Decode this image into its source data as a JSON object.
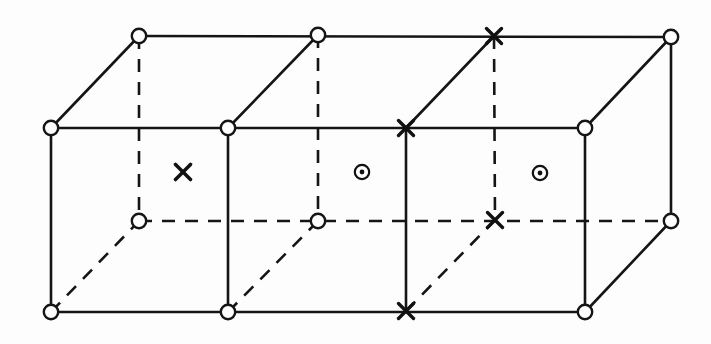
{
  "figure": {
    "background_color": "#fdfdfd",
    "line_color": "#151515",
    "canvas": {
      "width": 711,
      "height": 344
    }
  },
  "legend_symbols": [
    {
      "key": "open-circle",
      "glyph": "circle",
      "meaning": "lattice site marked by open circle"
    },
    {
      "key": "cross",
      "glyph": "x",
      "meaning": "spin pointing into the page"
    },
    {
      "key": "circle-dot",
      "glyph": "circle-dot",
      "meaning": "spin pointing out of the page"
    }
  ],
  "geometry": {
    "front_top_y": 128,
    "front_bottom_y": 312,
    "back_top_y": 36,
    "back_bottom_y": 221,
    "front_x": [
      51,
      228,
      406,
      585
    ],
    "back_x": [
      139,
      318,
      495,
      671
    ],
    "marker_radius": 7.2
  },
  "nodes": {
    "back_top": [
      {
        "name": "back-top-1",
        "x": 139,
        "y": 36,
        "symbol": "open-circle"
      },
      {
        "name": "back-top-2",
        "x": 318,
        "y": 35,
        "symbol": "open-circle"
      },
      {
        "name": "back-top-3",
        "x": 494,
        "y": 36,
        "symbol": "cross"
      },
      {
        "name": "back-top-4",
        "x": 671,
        "y": 37,
        "symbol": "open-circle"
      }
    ],
    "front_top": [
      {
        "name": "front-top-1",
        "x": 51,
        "y": 128,
        "symbol": "open-circle"
      },
      {
        "name": "front-top-2",
        "x": 228,
        "y": 128,
        "symbol": "open-circle"
      },
      {
        "name": "front-top-3",
        "x": 406,
        "y": 128,
        "symbol": "cross"
      },
      {
        "name": "front-top-4",
        "x": 585,
        "y": 128,
        "symbol": "open-circle"
      }
    ],
    "back_bottom": [
      {
        "name": "back-bottom-1",
        "x": 139,
        "y": 221,
        "symbol": "open-circle"
      },
      {
        "name": "back-bottom-2",
        "x": 318,
        "y": 221,
        "symbol": "open-circle"
      },
      {
        "name": "back-bottom-3",
        "x": 495,
        "y": 220,
        "symbol": "cross"
      },
      {
        "name": "back-bottom-4",
        "x": 671,
        "y": 221,
        "symbol": "open-circle"
      }
    ],
    "front_bottom": [
      {
        "name": "front-bottom-1",
        "x": 51,
        "y": 312,
        "symbol": "open-circle"
      },
      {
        "name": "front-bottom-2",
        "x": 228,
        "y": 312,
        "symbol": "open-circle"
      },
      {
        "name": "front-bottom-3",
        "x": 406,
        "y": 311,
        "symbol": "cross"
      },
      {
        "name": "front-bottom-4",
        "x": 585,
        "y": 312,
        "symbol": "open-circle"
      }
    ]
  },
  "face_symbols": [
    {
      "name": "face-spin-1",
      "x": 183,
      "y": 172,
      "symbol": "cross"
    },
    {
      "name": "face-spin-2",
      "x": 362,
      "y": 172,
      "symbol": "circle-dot"
    },
    {
      "name": "face-spin-3",
      "x": 540,
      "y": 173,
      "symbol": "circle-dot"
    }
  ],
  "edges": {
    "solid": [
      {
        "name": "edge-back-top-rail",
        "x1": 139,
        "y1": 36,
        "x2": 671,
        "y2": 37
      },
      {
        "name": "edge-front-top-rail",
        "x1": 51,
        "y1": 128,
        "x2": 585,
        "y2": 128
      },
      {
        "name": "edge-front-bottom-rail",
        "x1": 51,
        "y1": 312,
        "x2": 585,
        "y2": 312
      },
      {
        "name": "edge-front-vertical-1",
        "x1": 51,
        "y1": 128,
        "x2": 51,
        "y2": 312
      },
      {
        "name": "edge-front-vertical-2",
        "x1": 228,
        "y1": 128,
        "x2": 228,
        "y2": 312
      },
      {
        "name": "edge-front-vertical-3",
        "x1": 406,
        "y1": 128,
        "x2": 406,
        "y2": 311
      },
      {
        "name": "edge-front-vertical-4",
        "x1": 585,
        "y1": 128,
        "x2": 585,
        "y2": 312
      },
      {
        "name": "edge-back-vertical-right",
        "x1": 671,
        "y1": 37,
        "x2": 671,
        "y2": 221
      },
      {
        "name": "edge-depth-top-1",
        "x1": 51,
        "y1": 128,
        "x2": 139,
        "y2": 36
      },
      {
        "name": "edge-depth-top-2",
        "x1": 228,
        "y1": 128,
        "x2": 318,
        "y2": 35
      },
      {
        "name": "edge-depth-top-3",
        "x1": 406,
        "y1": 128,
        "x2": 494,
        "y2": 36
      },
      {
        "name": "edge-depth-top-4",
        "x1": 585,
        "y1": 128,
        "x2": 671,
        "y2": 37
      },
      {
        "name": "edge-depth-bottom-4",
        "x1": 585,
        "y1": 312,
        "x2": 671,
        "y2": 221
      }
    ],
    "dashed": [
      {
        "name": "edge-back-bottom-rail",
        "x1": 139,
        "y1": 221,
        "x2": 671,
        "y2": 221
      },
      {
        "name": "edge-back-vertical-1",
        "x1": 139,
        "y1": 36,
        "x2": 139,
        "y2": 221
      },
      {
        "name": "edge-back-vertical-2",
        "x1": 318,
        "y1": 35,
        "x2": 318,
        "y2": 221
      },
      {
        "name": "edge-back-vertical-3",
        "x1": 494,
        "y1": 36,
        "x2": 495,
        "y2": 220
      },
      {
        "name": "edge-depth-bottom-1",
        "x1": 51,
        "y1": 312,
        "x2": 139,
        "y2": 221
      },
      {
        "name": "edge-depth-bottom-2",
        "x1": 228,
        "y1": 312,
        "x2": 318,
        "y2": 221
      },
      {
        "name": "edge-depth-bottom-3",
        "x1": 406,
        "y1": 311,
        "x2": 495,
        "y2": 220
      }
    ]
  }
}
